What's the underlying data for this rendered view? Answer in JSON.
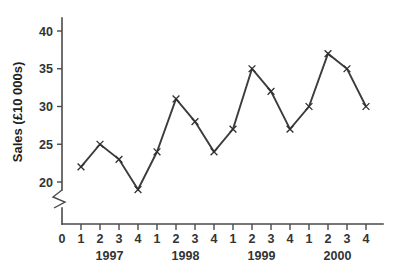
{
  "chart_data": {
    "type": "line",
    "title": "",
    "subtitle": "",
    "xlabel": "",
    "ylabel": "Sales (£10 000s)",
    "categories": [
      "1",
      "2",
      "3",
      "4",
      "1",
      "2",
      "3",
      "4",
      "1",
      "2",
      "3",
      "4",
      "1",
      "2",
      "3",
      "4"
    ],
    "values": [
      22,
      25,
      23,
      19,
      24,
      31,
      28,
      24,
      27,
      35,
      32,
      27,
      30,
      37,
      35,
      30
    ],
    "series": [
      {
        "name": "Sales",
        "values": [
          22,
          25,
          23,
          19,
          24,
          31,
          28,
          24,
          27,
          35,
          32,
          27,
          30,
          37,
          35,
          30
        ]
      }
    ],
    "group_labels": [
      "1997",
      "1998",
      "1999",
      "2000"
    ],
    "x_tick_labels": [
      "0",
      "1",
      "2",
      "3",
      "4",
      "1",
      "2",
      "3",
      "4",
      "1",
      "2",
      "3",
      "4",
      "1",
      "2",
      "3",
      "4"
    ],
    "y_tick_labels": [
      "20",
      "25",
      "30",
      "35",
      "40"
    ],
    "y_ticks": [
      20,
      25,
      30,
      35,
      40
    ],
    "ylim": [
      20,
      41
    ],
    "xlim": [
      0,
      17
    ],
    "grid": false,
    "legend": false,
    "axis_break": true,
    "marker": "x",
    "line_color": "#3c3c3c",
    "marker_color": "#2f2f2f",
    "axis_color": "#4a4a4a",
    "background_color": "#ffffff",
    "annotations": []
  }
}
